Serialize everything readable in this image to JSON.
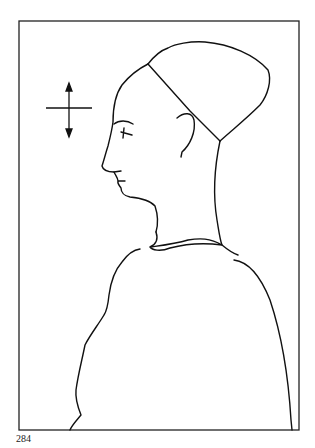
{
  "figure": {
    "frame_color": "#222222",
    "line_color": "#111111"
  },
  "orientation_marker": {
    "icon": "vertical-double-arrow-cross-icon"
  },
  "page_number": "284"
}
